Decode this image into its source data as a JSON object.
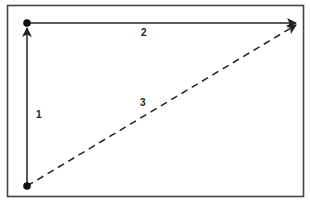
{
  "diagram": {
    "type": "vector-triangle",
    "colors": {
      "stroke": "#222222",
      "frame": "#444444",
      "background": "#ffffff"
    },
    "points": {
      "bottom_left": {
        "x": 27,
        "y": 186
      },
      "top_left": {
        "x": 27,
        "y": 23
      },
      "top_right": {
        "x": 296,
        "y": 23
      }
    },
    "vectors": [
      {
        "id": "1",
        "label": "1",
        "from": "bottom_left",
        "to": "top_left",
        "style": "solid"
      },
      {
        "id": "2",
        "label": "2",
        "from": "top_left",
        "to": "top_right",
        "style": "solid"
      },
      {
        "id": "3",
        "label": "3",
        "from": "bottom_left",
        "to": "top_right",
        "style": "dashed"
      }
    ]
  }
}
